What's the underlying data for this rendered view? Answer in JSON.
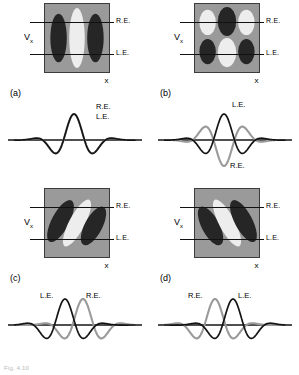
{
  "figure": {
    "caption": "Fig. 4.10",
    "axis_x_label": "x",
    "axis_v_label": "V",
    "axis_v_sub": "x",
    "eye_right_label": "R.E.",
    "eye_left_label": "L.E.",
    "colors": {
      "field_background": "#9a9a9a",
      "subregion_dark": "#262626",
      "subregion_light": "#ededed",
      "curve_right_eye": "#9a9a9a",
      "curve_left_eye": "#141414",
      "baseline": "#141414",
      "border": "#3c3c3c"
    }
  },
  "panels": [
    {
      "id": "a",
      "letter": "(a)",
      "receptive_field": {
        "type": "vertical-bars",
        "description": "Three vertical ellipses: dark, light, dark",
        "subregions": [
          {
            "shape": "ellipse",
            "cx": 14,
            "cy": 35,
            "rx": 8.5,
            "ry": 25,
            "rotation": 0,
            "fill": "dark"
          },
          {
            "shape": "ellipse",
            "cx": 33,
            "cy": 35,
            "rx": 8.0,
            "ry": 31,
            "rotation": 0,
            "fill": "light"
          },
          {
            "shape": "ellipse",
            "cx": 52,
            "cy": 35,
            "rx": 8.5,
            "ry": 25,
            "rotation": 0,
            "fill": "dark"
          }
        ]
      },
      "curve": {
        "label_top": "R.E.",
        "label_bottom": "L.E.",
        "label_top_x": 96,
        "label_top_y": 13,
        "label_bottom_x": 96,
        "label_bottom_y": 23,
        "right_eye_phase_deg": 0,
        "left_eye_phase_deg": 0,
        "right_eye_center": 0,
        "left_eye_center": 0,
        "relation": "identical, in-phase, zero disparity"
      }
    },
    {
      "id": "b",
      "letter": "(b)",
      "receptive_field": {
        "type": "checker-grid",
        "description": "Two rows of three ellipses: top light-dark-light, bottom dark-light-dark",
        "subregions": [
          {
            "shape": "ellipse",
            "cx": 13,
            "cy": 19,
            "rx": 8.5,
            "ry": 13,
            "rotation": 0,
            "fill": "light"
          },
          {
            "shape": "ellipse",
            "cx": 33,
            "cy": 18,
            "rx": 9.5,
            "ry": 15,
            "rotation": 0,
            "fill": "dark"
          },
          {
            "shape": "ellipse",
            "cx": 53,
            "cy": 19,
            "rx": 8.5,
            "ry": 13,
            "rotation": 0,
            "fill": "light"
          },
          {
            "shape": "ellipse",
            "cx": 13,
            "cy": 49,
            "rx": 8.5,
            "ry": 13,
            "rotation": 0,
            "fill": "dark"
          },
          {
            "shape": "ellipse",
            "cx": 33,
            "cy": 50,
            "rx": 9.5,
            "ry": 15,
            "rotation": 0,
            "fill": "light"
          },
          {
            "shape": "ellipse",
            "cx": 53,
            "cy": 49,
            "rx": 8.5,
            "ry": 13,
            "rotation": 0,
            "fill": "dark"
          }
        ]
      },
      "curve": {
        "label_top": "L.E.",
        "label_bottom": "R.E.",
        "label_top_x": 82,
        "label_top_y": 11,
        "label_bottom_x": 80,
        "label_bottom_y": 72,
        "right_eye_phase_deg": 180,
        "left_eye_phase_deg": 0,
        "right_eye_center": 0,
        "left_eye_center": 0,
        "relation": "180 degree phase disparity, anti-phase"
      }
    },
    {
      "id": "c",
      "letter": "(c)",
      "receptive_field": {
        "type": "oblique-bars-right",
        "description": "Three ellipses tilted clockwise: dark, light, dark",
        "subregions": [
          {
            "shape": "ellipse",
            "cx": 16,
            "cy": 33,
            "rx": 9,
            "ry": 24,
            "rotation": 28,
            "fill": "dark"
          },
          {
            "shape": "ellipse",
            "cx": 33,
            "cy": 35,
            "rx": 8,
            "ry": 27,
            "rotation": 28,
            "fill": "light"
          },
          {
            "shape": "ellipse",
            "cx": 50,
            "cy": 38,
            "rx": 9,
            "ry": 22,
            "rotation": 28,
            "fill": "dark"
          }
        ]
      },
      "curve": {
        "label_top": "L.E.",
        "label_bottom": "R.E.",
        "label_top_x": 40,
        "label_top_y": 17,
        "label_bottom_x": 86,
        "label_bottom_y": 17,
        "right_eye_phase_deg": 0,
        "left_eye_phase_deg": 0,
        "right_eye_center": 9,
        "left_eye_center": -9,
        "relation": "position disparity, L.E. leads R.E."
      }
    },
    {
      "id": "d",
      "letter": "(d)",
      "receptive_field": {
        "type": "oblique-bars-left",
        "description": "Three ellipses tilted counter-clockwise: dark, light, dark",
        "subregions": [
          {
            "shape": "ellipse",
            "cx": 16,
            "cy": 38,
            "rx": 9,
            "ry": 22,
            "rotation": -28,
            "fill": "dark"
          },
          {
            "shape": "ellipse",
            "cx": 33,
            "cy": 35,
            "rx": 8,
            "ry": 27,
            "rotation": -28,
            "fill": "light"
          },
          {
            "shape": "ellipse",
            "cx": 50,
            "cy": 33,
            "rx": 9,
            "ry": 24,
            "rotation": -28,
            "fill": "dark"
          }
        ]
      },
      "curve": {
        "label_top": "R.E.",
        "label_bottom": "L.E.",
        "label_top_x": 38,
        "label_top_y": 17,
        "label_bottom_x": 88,
        "label_bottom_y": 17,
        "right_eye_phase_deg": 0,
        "left_eye_phase_deg": 0,
        "right_eye_center": -9,
        "left_eye_center": 9,
        "relation": "position disparity, R.E. leads L.E."
      }
    }
  ]
}
